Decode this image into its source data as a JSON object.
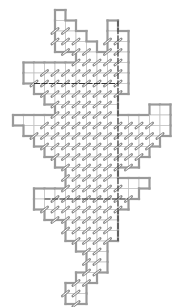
{
  "diagram": {
    "title": "",
    "type": "polyomino-tile-grid",
    "cell_size": 10.5,
    "origin": [
      13,
      10
    ],
    "colors": {
      "outline": "#9a9a9a",
      "cell_border": "#c4c4c4",
      "cell_fill": "#ffffff",
      "slash": "#8c8c8c",
      "divider": "#333333"
    },
    "rows": [
      {
        "r": 0,
        "ranges": [
          [
            4,
            4
          ]
        ]
      },
      {
        "r": 1,
        "ranges": [
          [
            4,
            5
          ],
          [
            9,
            9
          ]
        ]
      },
      {
        "r": 2,
        "ranges": [
          [
            4,
            6
          ],
          [
            9,
            10
          ]
        ]
      },
      {
        "r": 3,
        "ranges": [
          [
            4,
            7
          ],
          [
            9,
            10
          ]
        ]
      },
      {
        "r": 4,
        "ranges": [
          [
            6,
            10
          ]
        ]
      },
      {
        "r": 5,
        "ranges": [
          [
            1,
            10
          ]
        ]
      },
      {
        "r": 6,
        "ranges": [
          [
            1,
            10
          ]
        ]
      },
      {
        "r": 7,
        "ranges": [
          [
            2,
            10
          ]
        ]
      },
      {
        "r": 8,
        "ranges": [
          [
            3,
            9
          ]
        ]
      },
      {
        "r": 9,
        "ranges": [
          [
            4,
            9
          ],
          [
            13,
            14
          ]
        ]
      },
      {
        "r": 10,
        "ranges": [
          [
            0,
            14
          ]
        ]
      },
      {
        "r": 11,
        "ranges": [
          [
            1,
            14
          ]
        ]
      },
      {
        "r": 12,
        "ranges": [
          [
            2,
            13
          ]
        ]
      },
      {
        "r": 13,
        "ranges": [
          [
            3,
            12
          ]
        ]
      },
      {
        "r": 14,
        "ranges": [
          [
            4,
            11
          ]
        ]
      },
      {
        "r": 15,
        "ranges": [
          [
            5,
            9
          ]
        ]
      },
      {
        "r": 16,
        "ranges": [
          [
            5,
            12
          ]
        ]
      },
      {
        "r": 17,
        "ranges": [
          [
            2,
            11
          ]
        ]
      },
      {
        "r": 18,
        "ranges": [
          [
            2,
            10
          ]
        ]
      },
      {
        "r": 19,
        "ranges": [
          [
            3,
            9
          ]
        ]
      },
      {
        "r": 20,
        "ranges": [
          [
            5,
            9
          ]
        ]
      },
      {
        "r": 21,
        "ranges": [
          [
            5,
            9
          ]
        ]
      },
      {
        "r": 22,
        "ranges": [
          [
            6,
            8
          ]
        ]
      },
      {
        "r": 23,
        "ranges": [
          [
            7,
            8
          ]
        ]
      },
      {
        "r": 24,
        "ranges": [
          [
            7,
            8
          ]
        ]
      },
      {
        "r": 25,
        "ranges": [
          [
            6,
            7
          ]
        ]
      },
      {
        "r": 26,
        "ranges": [
          [
            5,
            6
          ]
        ]
      },
      {
        "r": 27,
        "ranges": [
          [
            5,
            6
          ]
        ]
      }
    ],
    "plain_cells": [
      [
        0,
        4
      ],
      [
        1,
        9
      ],
      [
        5,
        1
      ],
      [
        5,
        2
      ],
      [
        10,
        0
      ],
      [
        10,
        1
      ],
      [
        10,
        2
      ],
      [
        16,
        11
      ],
      [
        16,
        12
      ],
      [
        17,
        2
      ],
      [
        17,
        3
      ],
      [
        9,
        13
      ],
      [
        9,
        14
      ],
      [
        10,
        14
      ]
    ],
    "divider_col": 10,
    "divider_rows": [
      1,
      22
    ],
    "divider_row_lines": [
      {
        "r": 7,
        "c0": 2,
        "c1": 10
      },
      {
        "r": 18,
        "c0": 3,
        "c1": 11
      }
    ]
  }
}
